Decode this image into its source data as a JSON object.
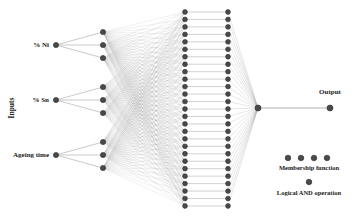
{
  "diagram": {
    "background_color": "#ffffff",
    "node_color": "#4a4a4a",
    "node_edge_color": "#2b2b2b",
    "edge_color": "#8c8c8c",
    "text_color": "#1a1a1a"
  },
  "axis": {
    "inputs_label": "Inputs"
  },
  "inputs": [
    {
      "label": "% Ni",
      "x": 56,
      "y": 45
    },
    {
      "label": "% Sn",
      "x": 56,
      "y": 100
    },
    {
      "label": "Ageing time",
      "x": 56,
      "y": 155
    }
  ],
  "layers": {
    "membership": {
      "x": 103,
      "count": 9,
      "groups": 3,
      "per_group": 3,
      "group_centers": [
        45,
        100,
        155
      ],
      "group_spacing": 13
    },
    "rules": {
      "x": 185,
      "count": 27,
      "y_start": 12,
      "y_end": 206
    },
    "normalize": {
      "x": 228,
      "count": 27,
      "y_start": 12,
      "y_end": 206
    },
    "aggregate": {
      "x": 258,
      "y": 108
    },
    "output": {
      "x": 330,
      "y": 108
    }
  },
  "output": {
    "label": "Output",
    "label_x": 330,
    "label_y": 92
  },
  "legend": [
    {
      "label": "Membership function",
      "dot_count": 4,
      "dots_y": 158,
      "dots_start_x": 288,
      "dot_spacing": 13,
      "label_x": 309,
      "label_y": 168
    },
    {
      "label": "Logical AND operation",
      "dot_count": 1,
      "dots_y": 182,
      "dots_start_x": 309,
      "dot_spacing": 13,
      "label_x": 309,
      "label_y": 193
    }
  ]
}
